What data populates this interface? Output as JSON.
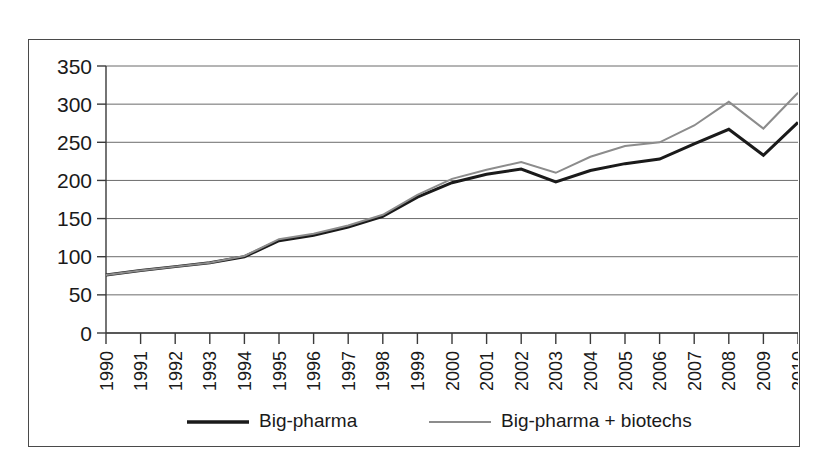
{
  "chart_data": {
    "type": "line",
    "title": "",
    "subtitle": "",
    "xlabel": "",
    "ylabel": "",
    "grid": true,
    "legend_position": "bottom",
    "xlim": [
      1990,
      2010
    ],
    "ylim": [
      0,
      350
    ],
    "ytick_labels": [
      "350",
      "300",
      "250",
      "200",
      "150",
      "100",
      "50",
      "0"
    ],
    "ytick_values": [
      350,
      300,
      250,
      200,
      150,
      100,
      50,
      0
    ],
    "categories": [
      "1990",
      "1991",
      "1992",
      "1993",
      "1994",
      "1995",
      "1996",
      "1997",
      "1998",
      "1999",
      "2000",
      "2001",
      "2002",
      "2003",
      "2004",
      "2005",
      "2006",
      "2007",
      "2008",
      "2009",
      "2010"
    ],
    "series": [
      {
        "name": "Big-pharma",
        "color": "#1a1a1a",
        "values": [
          76,
          82,
          87,
          92,
          100,
          121,
          128,
          139,
          153,
          178,
          197,
          208,
          215,
          198,
          213,
          222,
          228,
          248,
          267,
          233,
          276
        ]
      },
      {
        "name": "Big-pharma + biotechs",
        "color": "#8c8c8c",
        "values": [
          76,
          82,
          87,
          92,
          101,
          123,
          130,
          141,
          155,
          181,
          202,
          214,
          224,
          210,
          231,
          245,
          250,
          272,
          303,
          268,
          315
        ]
      }
    ]
  },
  "legend": {
    "entries": [
      {
        "label": "Big-pharma",
        "color": "#1a1a1a"
      },
      {
        "label": "Big-pharma + biotechs",
        "color": "#8c8c8c"
      }
    ]
  }
}
